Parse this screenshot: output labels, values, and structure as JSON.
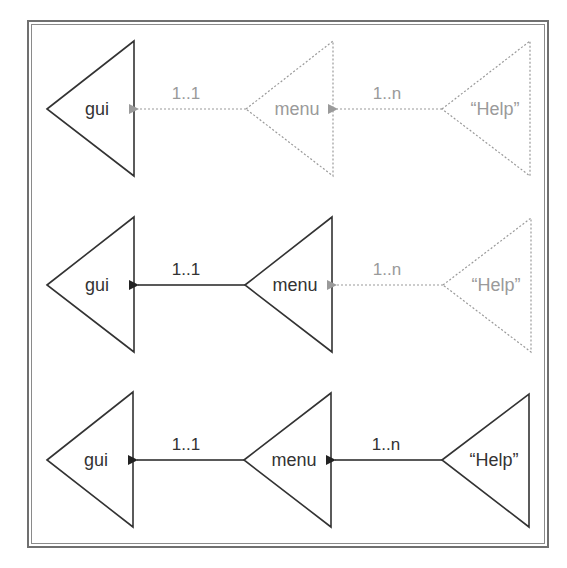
{
  "diagram": {
    "type": "composition-stages",
    "colors": {
      "active": "#222222",
      "inactive": "#9a9a9a",
      "frame": "#707070"
    },
    "rows": [
      {
        "nodes": [
          {
            "label": "gui",
            "active": true
          },
          {
            "label": "menu",
            "active": false
          },
          {
            "label": "“Help”",
            "active": false
          }
        ],
        "edges": [
          {
            "label": "1..1",
            "active": false
          },
          {
            "label": "1..n",
            "active": false
          }
        ]
      },
      {
        "nodes": [
          {
            "label": "gui",
            "active": true
          },
          {
            "label": "menu",
            "active": true
          },
          {
            "label": "“Help”",
            "active": false
          }
        ],
        "edges": [
          {
            "label": "1..1",
            "active": true
          },
          {
            "label": "1..n",
            "active": false
          }
        ]
      },
      {
        "nodes": [
          {
            "label": "gui",
            "active": true
          },
          {
            "label": "menu",
            "active": true
          },
          {
            "label": "“Help”",
            "active": true
          }
        ],
        "edges": [
          {
            "label": "1..1",
            "active": true
          },
          {
            "label": "1..n",
            "active": true
          }
        ]
      }
    ]
  }
}
